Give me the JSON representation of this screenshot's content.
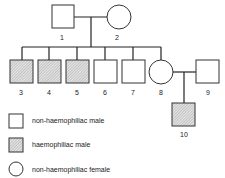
{
  "pedigree": {
    "individuals": [
      {
        "id": "1",
        "label": "1",
        "sex": "male",
        "affected": false
      },
      {
        "id": "2",
        "label": "2",
        "sex": "female",
        "affected": false
      },
      {
        "id": "3",
        "label": "3",
        "sex": "male",
        "affected": true
      },
      {
        "id": "4",
        "label": "4",
        "sex": "male",
        "affected": true
      },
      {
        "id": "5",
        "label": "5",
        "sex": "male",
        "affected": true
      },
      {
        "id": "6",
        "label": "6",
        "sex": "male",
        "affected": false
      },
      {
        "id": "7",
        "label": "7",
        "sex": "male",
        "affected": false
      },
      {
        "id": "8",
        "label": "8",
        "sex": "female",
        "affected": false
      },
      {
        "id": "9",
        "label": "9",
        "sex": "male",
        "affected": false
      },
      {
        "id": "10",
        "label": "10",
        "sex": "male",
        "affected": true
      }
    ]
  },
  "legend": {
    "items": [
      {
        "symbol": "square",
        "label": "non-haemophiliac male"
      },
      {
        "symbol": "hatched-square",
        "label": "haemophiliac male"
      },
      {
        "symbol": "circle",
        "label": "non-haemophiliac female"
      }
    ]
  }
}
